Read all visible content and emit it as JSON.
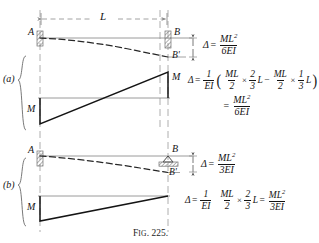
{
  "figure": {
    "caption_prefix": "F",
    "caption_small": "IG",
    "caption_number": ". 225."
  },
  "dimension": {
    "span_label": "L"
  },
  "case_a": {
    "case_label": "(a)",
    "point_a": "A",
    "point_b": "B",
    "point_b_deflected": "B'",
    "moment_left": "M",
    "moment_right": "M",
    "result": {
      "delta": "Δ",
      "equals": "=",
      "numerator": "ML",
      "num_exp": "2",
      "denominator": "6EI"
    },
    "derivation": {
      "delta": "Δ",
      "equals": "=",
      "coef_num": "1",
      "coef_den": "EI",
      "open_paren": "(",
      "t1_num": "ML",
      "t1_den": "2",
      "t1_times": "×",
      "t1_frac_num": "2",
      "t1_frac_den": "3",
      "t1_tail": "L",
      "minus": "−",
      "t2_num": "ML",
      "t2_den": "2",
      "t2_times": "×",
      "t2_frac_num": "1",
      "t2_frac_den": "3",
      "t2_tail": "L",
      "close_paren": ")"
    },
    "derivation_result": {
      "equals": "=",
      "numerator": "ML",
      "num_exp": "2",
      "denominator": "6EI"
    }
  },
  "case_b": {
    "case_label": "(b)",
    "point_a": "A",
    "point_b": "B",
    "point_b_deflected": "B'",
    "moment_left": "M",
    "result": {
      "delta": "Δ",
      "equals": "=",
      "numerator": "ML",
      "num_exp": "2",
      "denominator": "3EI"
    },
    "derivation": {
      "delta": "Δ",
      "equals": "=",
      "coef_num": "1",
      "coef_den": "EI",
      "t1_num": "ML",
      "t1_den": "2",
      "t1_times": "×",
      "t1_frac_num": "2",
      "t1_frac_den": "3",
      "t1_tail": "L",
      "eq2": "=",
      "r_num": "ML",
      "r_exp": "2",
      "r_den": "3EI"
    }
  },
  "colors": {
    "ink": "#141414",
    "construction": "#8a8a8a",
    "hatch": "#6e6e6e"
  }
}
